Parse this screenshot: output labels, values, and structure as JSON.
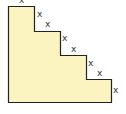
{
  "diagram": {
    "type": "staircase-polygon",
    "fill_color": "#fbf3c0",
    "stroke_color": "#222222",
    "steps": 4,
    "labels": [
      {
        "text": "x",
        "x": 21,
        "y": 3
      },
      {
        "text": "x",
        "x": 38,
        "y": 17
      },
      {
        "text": "x",
        "x": 46,
        "y": 27
      },
      {
        "text": "x",
        "x": 63,
        "y": 41
      },
      {
        "text": "x",
        "x": 72,
        "y": 52
      },
      {
        "text": "x",
        "x": 89,
        "y": 66
      },
      {
        "text": "x",
        "x": 98,
        "y": 76
      },
      {
        "text": "x",
        "x": 114,
        "y": 93
      }
    ]
  }
}
